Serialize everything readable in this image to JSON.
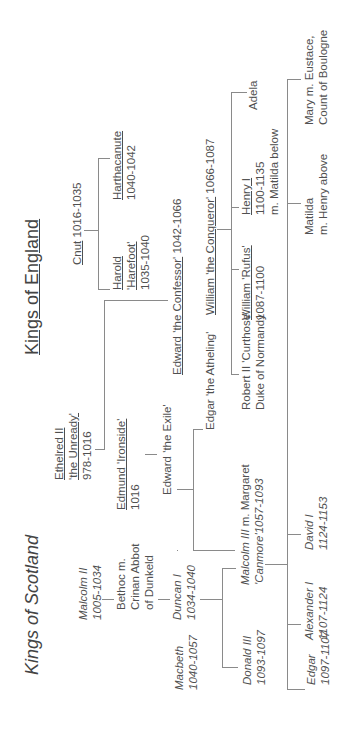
{
  "titles": {
    "england": "Kings of England",
    "scotland": "Kings of Scotland"
  },
  "england": {
    "cnut": {
      "name": "Cnut",
      "dates": " 1016-1035"
    },
    "harold": {
      "line1": "Harold",
      "line2": "'Harefoot'",
      "line3": "1035-1040"
    },
    "harthacanute": {
      "line1": "Harthacanute",
      "line2": "1040-1042"
    },
    "ethelred": {
      "line1": "Ethelred II",
      "line2": "'the Unready'",
      "line3": "978-1016"
    },
    "edmund": {
      "line1": "Edmund 'Ironside'",
      "line2": "1016"
    },
    "edward_exile": {
      "line1": "Edward 'the Exile'"
    },
    "edward_confessor": {
      "name": "Edward 'the Confessor'",
      "dates": " 1042-1066"
    },
    "edgar_atheling": {
      "line1": "Edgar 'the Atheling'"
    },
    "william_conqueror": {
      "name": "William 'the Conqueror'",
      "dates": " 1066-1087"
    },
    "robert": {
      "line1": "Robert II 'Curthose'",
      "line2": "Duke of Normandy"
    },
    "william_rufus": {
      "line1": "William 'Rufus'",
      "line2": "1087-1100"
    },
    "henry": {
      "line1": "Henry I",
      "line2": "1100-1135",
      "line3": "m. Matilda below"
    },
    "adela": {
      "line1": "Adela"
    },
    "matilda": {
      "line1": "Matilda",
      "line2": "m. Henry above"
    },
    "mary": {
      "line1": "Mary m. Eustace,",
      "line2": "Count of Boulogne"
    }
  },
  "scotland": {
    "malcolm2": {
      "line1": "Malcolm II",
      "line2": "1005-1034"
    },
    "bethoc": {
      "line1": "Bethoc m.",
      "line2": "Crinan Abbot",
      "line3": "of Dunkeld"
    },
    "duncan": {
      "line1": "Duncan I",
      "line2": "1034-1040"
    },
    "macbeth": {
      "line1": "Macbeth",
      "line2": "1040-1057"
    },
    "malcolm3": {
      "line1a": "Malcolm III",
      "line1b": " m. Margaret",
      "line2": "'Canmore'1057-1093"
    },
    "donald3": {
      "line1": "Donald III",
      "line2": "1093-1097"
    },
    "edgar": {
      "line1": "Edgar",
      "line2": "1097-1107"
    },
    "alexander": {
      "line1": "Alexander I",
      "line2": "1107-1124"
    },
    "david": {
      "line1": "David I",
      "line2": "1124-1153"
    }
  }
}
